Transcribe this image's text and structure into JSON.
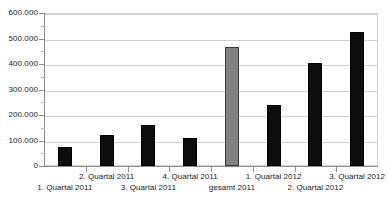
{
  "chart_data": {
    "type": "bar",
    "title": "",
    "xlabel": "",
    "ylabel": "",
    "ylim": [
      0,
      600000
    ],
    "ytick_step": 100000,
    "yminor_step": 50000,
    "grid": true,
    "legend": "none",
    "number_format": "de-DE (period thousands separator)",
    "categories": [
      "1. Quartal 2011",
      "2. Quartal 2011",
      "3. Quartal 2011",
      "4. Quartal 2011",
      "gesamt 2011",
      "1. Quartal 2012",
      "2. Quartal 2012",
      "3. Quartal 2012"
    ],
    "values": [
      75000,
      122000,
      160000,
      110000,
      468000,
      240000,
      405000,
      525000
    ],
    "bar_colors": [
      "#0d0d0d",
      "#0d0d0d",
      "#0d0d0d",
      "#0d0d0d",
      "#808080",
      "#0d0d0d",
      "#0d0d0d",
      "#0d0d0d"
    ],
    "ytick_labels": [
      "600.000",
      "500.000",
      "400.000",
      "300.000",
      "200.000",
      "100.000",
      "0"
    ],
    "ytick_values": [
      600000,
      500000,
      400000,
      300000,
      200000,
      100000,
      0
    ],
    "label_rows": [
      "bottom",
      "top",
      "bottom",
      "top",
      "bottom",
      "top",
      "bottom",
      "top"
    ],
    "colors": {
      "background": "#ffffff",
      "gridline": "#d0d0d0",
      "axis": "#8d8d8d",
      "text": "#1a1a1a",
      "bar_primary": "#0d0d0d",
      "bar_highlight": "#808080"
    }
  }
}
